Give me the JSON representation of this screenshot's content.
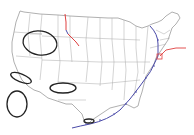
{
  "map": {
    "region": "Contiguous United States",
    "title_fragment": "",
    "colors": {
      "state_border": "#9a9a9a",
      "cold_front": "#4a4aa8",
      "warm_front": "#e04040",
      "annotation": "#222222",
      "background": "#ffffff"
    },
    "fronts": [
      {
        "type": "warm-front",
        "location": "Montana/Wyoming vertical segment"
      },
      {
        "type": "cold-front",
        "location": "Wyoming junction"
      },
      {
        "type": "warm-front",
        "location": "Wyoming to Nebraska diagonal"
      },
      {
        "type": "cold-front",
        "location": "Great Lakes through Atlantic coast to Gulf of Mexico"
      },
      {
        "type": "warm-front",
        "location": "Mid-Atlantic extending east offshore"
      }
    ],
    "annotations": [
      {
        "shape": "ellipse",
        "location": "Nevada/Utah"
      },
      {
        "shape": "ellipse",
        "location": "Southern California coast"
      },
      {
        "shape": "ellipse",
        "location": "Pacific offshore"
      },
      {
        "shape": "ellipse",
        "location": "New Mexico/Texas"
      },
      {
        "shape": "ellipse",
        "location": "Texas Gulf coast"
      }
    ]
  }
}
